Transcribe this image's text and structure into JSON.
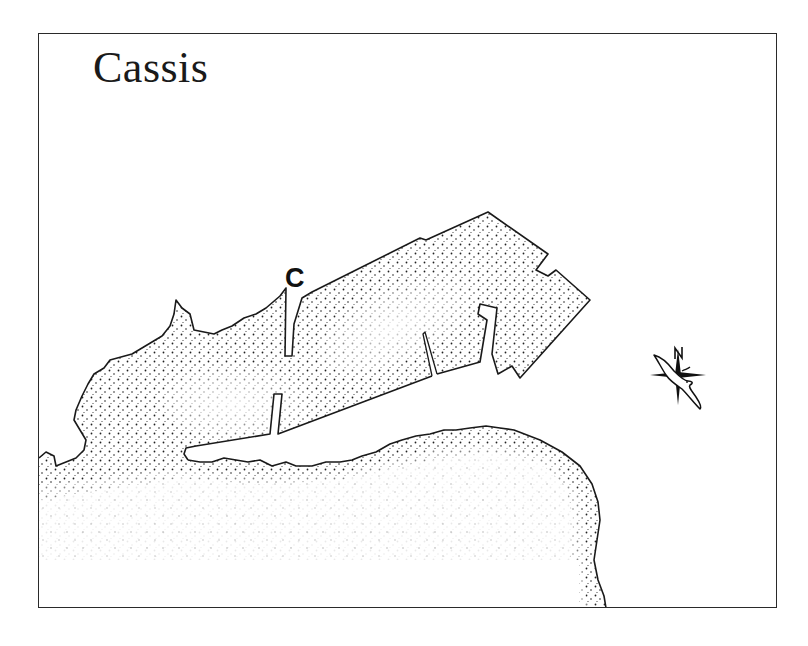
{
  "map": {
    "title": "Cassis",
    "markers": [
      {
        "label": "C",
        "description": "location marker near harbor entrance breakwater"
      }
    ],
    "compass": {
      "icon": "compass-rose-icon",
      "north_label": "N",
      "decoration": "seagull"
    },
    "legend": {
      "water_style": "stippled dots",
      "land_style": "white"
    },
    "colors": {
      "ink": "#1a1a1a",
      "paper": "#ffffff"
    }
  }
}
